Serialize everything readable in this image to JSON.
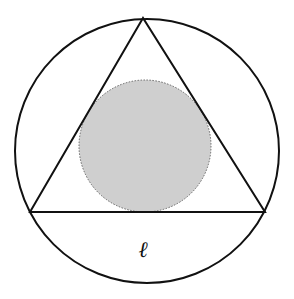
{
  "diagram": {
    "title": "",
    "outer_circle": {
      "cx": 147,
      "cy": 151,
      "r": 132,
      "stroke": "#111111",
      "stroke_width": 2,
      "fill": "none"
    },
    "triangle": {
      "points": [
        [
          143,
          18
        ],
        [
          30,
          212
        ],
        [
          265,
          212
        ]
      ],
      "stroke": "#111111",
      "stroke_width": 2,
      "fill": "none"
    },
    "inner_circle": {
      "cx": 145,
      "cy": 146,
      "r": 66,
      "fill": "#cfcfcf",
      "stroke": "#666666",
      "stroke_dasharray": "1.5,1.5"
    },
    "labels": {
      "base_label": "ℓ",
      "base_label_x": 143,
      "base_label_y": 257
    }
  }
}
